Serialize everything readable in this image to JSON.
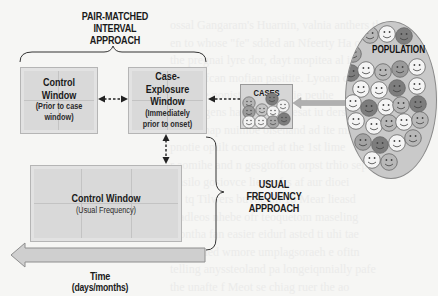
{
  "diagram": {
    "pair_matched": {
      "title_line1": "PAIR-MATCHED",
      "title_line2": "INTERVAL APPROACH"
    },
    "control_window_prior": {
      "title_line1": "Control",
      "title_line2": "Window",
      "sub_line1": "(Prior to case",
      "sub_line2": "window)"
    },
    "case_exposure_window": {
      "title_line1": "Case-",
      "title_line2": "Explosure",
      "title_line3": "Window",
      "sub_line1": "(Immediately",
      "sub_line2": "prior to onset)"
    },
    "cases": {
      "label": "CASES"
    },
    "population": {
      "label": "POPULATION"
    },
    "control_window_usual": {
      "title": "Control Window",
      "sub": "(Usual Frequency)"
    },
    "usual_frequency": {
      "title_line1": "USUAL FREQUENCY",
      "title_line2": "APPROACH"
    },
    "time_axis": {
      "label_line1": "Time",
      "label_line2": "(days/months)"
    },
    "colors": {
      "box_fill": "#d9d9d9",
      "arrow_fill": "#cfcfcf",
      "face_light": "#f4f4f4",
      "face_mid": "#b8b8b8",
      "face_dark": "#7d7d7d"
    }
  }
}
